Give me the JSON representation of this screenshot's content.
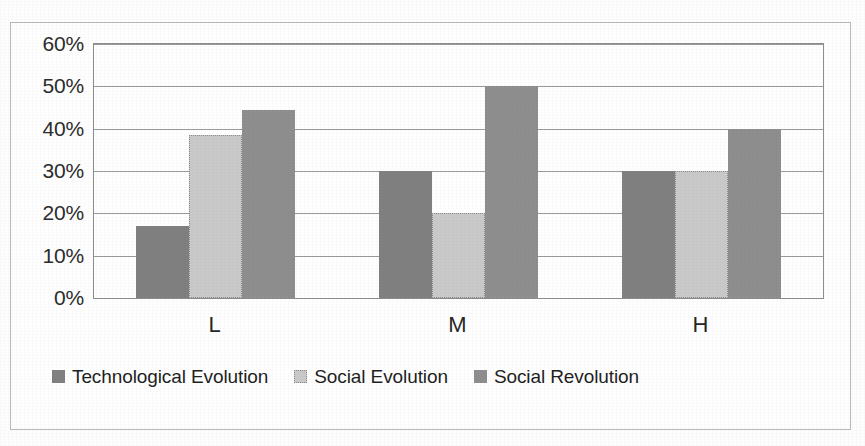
{
  "chart_data": {
    "type": "bar",
    "title": "",
    "subtitle": "",
    "xlabel": "",
    "ylabel": "",
    "categories": [
      "L",
      "M",
      "H"
    ],
    "series": [
      {
        "name": "Technological Evolution",
        "color": "#808080",
        "values": [
          17,
          30,
          30
        ]
      },
      {
        "name": "Social Evolution",
        "color": "#c9c9c9",
        "values": [
          38.5,
          20,
          30
        ]
      },
      {
        "name": "Social Revolution",
        "color": "#8e8e8e",
        "values": [
          44.5,
          50,
          40
        ]
      }
    ],
    "ylim": [
      0,
      60
    ],
    "ytick_values": [
      0,
      10,
      20,
      30,
      40,
      50,
      60
    ],
    "ytick_labels": [
      "0%",
      "10%",
      "20%",
      "30%",
      "40%",
      "50%",
      "60%"
    ],
    "grid": true,
    "grid_axis": "y",
    "legend_position": "bottom",
    "value_format": "percent",
    "annotations": []
  },
  "axes": {
    "y": {
      "ticks": [
        {
          "label": "60%",
          "value": 60
        },
        {
          "label": "50%",
          "value": 50
        },
        {
          "label": "40%",
          "value": 40
        },
        {
          "label": "30%",
          "value": 30
        },
        {
          "label": "20%",
          "value": 20
        },
        {
          "label": "10%",
          "value": 10
        },
        {
          "label": "0%",
          "value": 0
        }
      ]
    },
    "x": {
      "ticks": [
        {
          "label": "L"
        },
        {
          "label": "M"
        },
        {
          "label": "H"
        }
      ]
    }
  },
  "legend": {
    "items": [
      {
        "label": "Technological Evolution",
        "swatch": "legend-swatch-technological-evolution"
      },
      {
        "label": "Social Evolution",
        "swatch": "legend-swatch-social-evolution"
      },
      {
        "label": "Social Revolution",
        "swatch": "legend-swatch-social-revolution"
      }
    ]
  },
  "caption": {
    "text": ""
  }
}
